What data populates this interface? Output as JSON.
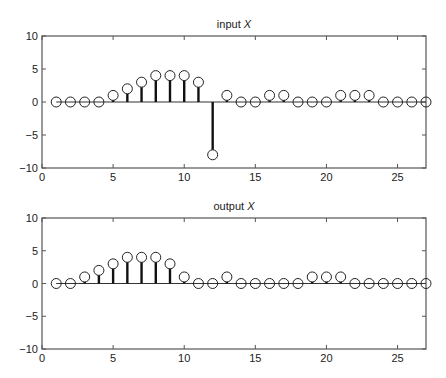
{
  "chart_data": [
    {
      "type": "stem",
      "title": "input X",
      "title_prefix": "input",
      "title_var": "X",
      "xlabel": "",
      "ylabel": "",
      "xlim": [
        0,
        27
      ],
      "ylim": [
        -10,
        10
      ],
      "xticks": [
        0,
        5,
        10,
        15,
        20,
        25
      ],
      "yticks": [
        -10,
        -5,
        0,
        5,
        10
      ],
      "grid": false,
      "x": [
        1,
        2,
        3,
        4,
        5,
        6,
        7,
        8,
        9,
        10,
        11,
        12,
        13,
        14,
        15,
        16,
        17,
        18,
        19,
        20,
        21,
        22,
        23,
        24,
        25,
        26,
        27
      ],
      "values": [
        0,
        0,
        0,
        0,
        1,
        2,
        3,
        4,
        4,
        4,
        3,
        -8,
        1,
        0,
        0,
        1,
        1,
        0,
        0,
        0,
        1,
        1,
        1,
        0,
        0,
        0,
        0
      ]
    },
    {
      "type": "stem",
      "title": "output X",
      "title_prefix": "output",
      "title_var": "X",
      "xlabel": "",
      "ylabel": "",
      "xlim": [
        0,
        27
      ],
      "ylim": [
        -10,
        10
      ],
      "xticks": [
        0,
        5,
        10,
        15,
        20,
        25
      ],
      "yticks": [
        -10,
        -5,
        0,
        5,
        10
      ],
      "grid": false,
      "x": [
        1,
        2,
        3,
        4,
        5,
        6,
        7,
        8,
        9,
        10,
        11,
        12,
        13,
        14,
        15,
        16,
        17,
        18,
        19,
        20,
        21,
        22,
        23,
        24,
        25,
        26,
        27
      ],
      "values": [
        0,
        0,
        1,
        2,
        3,
        4,
        4,
        4,
        3,
        1,
        0,
        0,
        1,
        0,
        0,
        0,
        0,
        0,
        1,
        1,
        1,
        0,
        0,
        0,
        0,
        0,
        0
      ]
    }
  ],
  "colors": {
    "axis": "#555555",
    "stem": "#111111",
    "marker": "#222222"
  }
}
